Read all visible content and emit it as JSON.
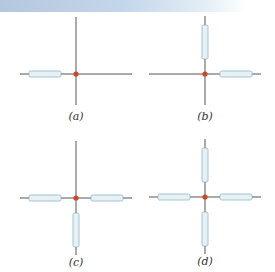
{
  "colors": {
    "band_left": "#b3c7df",
    "line": "#555555",
    "rod_fill": "#e6f1f5",
    "rod_stroke": "#8fb6c4",
    "center_dot": "#d2452c"
  },
  "panels": [
    {
      "id": "a",
      "label": "(a)",
      "center": [
        76,
        74
      ],
      "rods": [
        "left"
      ]
    },
    {
      "id": "b",
      "label": "(b)",
      "center": [
        205,
        74
      ],
      "rods": [
        "up",
        "right"
      ]
    },
    {
      "id": "c",
      "label": "(c)",
      "center": [
        76,
        198
      ],
      "rods": [
        "left",
        "right",
        "down"
      ]
    },
    {
      "id": "d",
      "label": "(d)",
      "center": [
        205,
        197
      ],
      "rods": [
        "up",
        "left",
        "right",
        "down"
      ]
    }
  ]
}
